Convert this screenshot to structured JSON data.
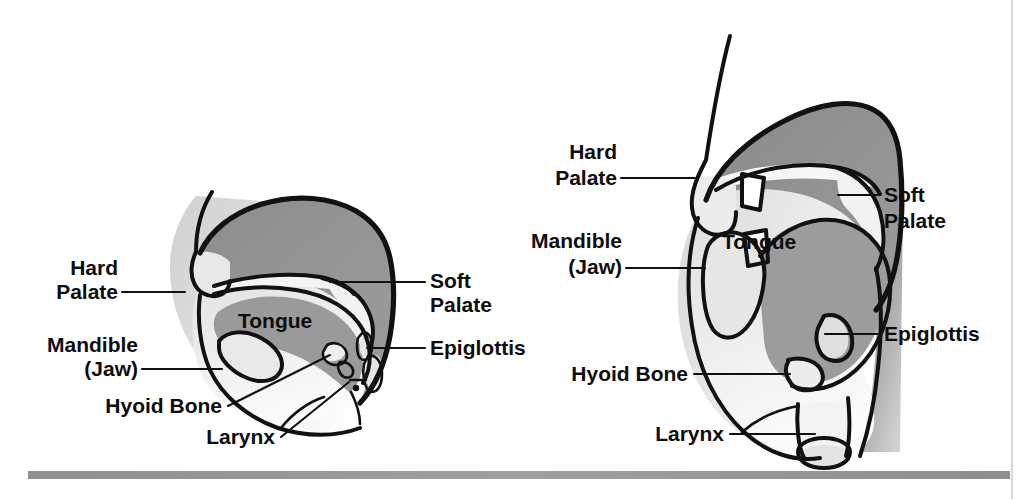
{
  "page": {
    "background_color": "#ffffff",
    "width": 1027,
    "height": 499,
    "divider_color": "#9a9a9a",
    "page_edge_color": "#dddddd"
  },
  "palette": {
    "ink": "#111111",
    "tissue_dark": "#8a8a8a",
    "tissue_mid": "#b8b8b8",
    "tissue_light": "#dcdcdc",
    "cavity_light": "#efefef",
    "paper": "#ffffff"
  },
  "figure": {
    "type": "anatomical-diagram",
    "view_count": 2,
    "label_set": [
      "Hard Palate",
      "Soft Palate",
      "Tongue",
      "Mandible (Jaw)",
      "Epiglottis",
      "Hyoid Bone",
      "Larynx"
    ]
  },
  "diagrams": [
    {
      "id": "left-diagram",
      "name": "sagittal-head-small",
      "labels": [
        {
          "id": "hard-palate",
          "line1": "Hard",
          "line2": "Palate",
          "side": "left",
          "text_x": 118,
          "text_y": 275,
          "text_y2": 299,
          "leader": "M122,292 L185,292"
        },
        {
          "id": "mandible-jaw",
          "line1": "Mandible",
          "line2": "(Jaw)",
          "side": "left",
          "text_x": 138,
          "text_y": 352,
          "text_y2": 376,
          "leader": "M142,369 L222,369"
        },
        {
          "id": "hyoid-bone",
          "line1": "Hyoid Bone",
          "line2": "",
          "side": "left",
          "text_x": 222,
          "text_y": 413,
          "text_y2": null,
          "leader": "M228,406 L330,355"
        },
        {
          "id": "larynx",
          "line1": "Larynx",
          "line2": "",
          "side": "left",
          "text_x": 275,
          "text_y": 444,
          "text_y2": null,
          "leader": "M281,437 L349,382"
        },
        {
          "id": "soft-palate",
          "line1": "Soft",
          "line2": "Palate",
          "side": "right",
          "text_x": 430,
          "text_y": 288,
          "text_y2": 312,
          "leader": "M425,282 L330,282"
        },
        {
          "id": "epiglottis",
          "line1": "Epiglottis",
          "line2": "",
          "side": "right",
          "text_x": 430,
          "text_y": 355,
          "text_y2": null,
          "leader": "M425,348 L367,348"
        },
        {
          "id": "tongue",
          "line1": "Tongue",
          "line2": "",
          "side": "inline",
          "text_x": 238,
          "text_y": 328,
          "text_y2": null,
          "leader": ""
        }
      ]
    },
    {
      "id": "right-diagram",
      "name": "sagittal-head-large",
      "labels": [
        {
          "id": "hard-palate",
          "line1": "Hard",
          "line2": "Palate",
          "side": "left",
          "text_x": 617,
          "text_y": 159,
          "text_y2": 185,
          "leader": "M621,178 L695,178"
        },
        {
          "id": "mandible-jaw",
          "line1": "Mandible",
          "line2": "(Jaw)",
          "side": "left",
          "text_x": 622,
          "text_y": 248,
          "text_y2": 274,
          "leader": "M626,268 L705,268"
        },
        {
          "id": "hyoid-bone",
          "line1": "Hyoid Bone",
          "line2": "",
          "side": "left",
          "text_x": 688,
          "text_y": 381,
          "text_y2": null,
          "leader": "M694,374 L790,374"
        },
        {
          "id": "larynx",
          "line1": "Larynx",
          "line2": "",
          "side": "left",
          "text_x": 724,
          "text_y": 441,
          "text_y2": null,
          "leader": "M730,434 L815,434"
        },
        {
          "id": "soft-palate",
          "line1": "Soft",
          "line2": "Palate",
          "side": "right",
          "text_x": 884,
          "text_y": 202,
          "text_y2": 228,
          "leader": "M878,195 L838,195"
        },
        {
          "id": "epiglottis",
          "line1": "Epiglottis",
          "line2": "",
          "side": "right",
          "text_x": 884,
          "text_y": 341,
          "text_y2": null,
          "leader": "M878,334 L825,334"
        },
        {
          "id": "tongue",
          "line1": "Tongue",
          "line2": "",
          "side": "inline",
          "text_x": 722,
          "text_y": 249,
          "text_y2": null,
          "leader": ""
        }
      ]
    }
  ]
}
